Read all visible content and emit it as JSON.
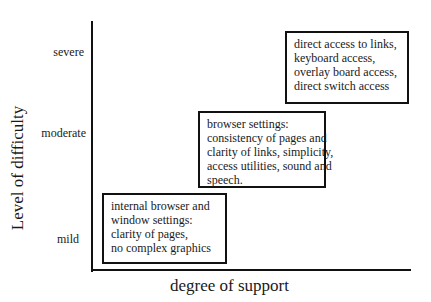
{
  "diagram": {
    "y_axis_label": "Level of difficulty",
    "x_axis_label": "degree of support",
    "y_ticks": [
      "severe",
      "moderate",
      "mild"
    ],
    "boxes": [
      {
        "level": "mild",
        "lines": [
          "internal browser and",
          "window settings:",
          "clarity of pages,",
          "no complex graphics"
        ]
      },
      {
        "level": "moderate",
        "lines": [
          "browser settings:",
          "consistency of pages and",
          "clarity of links, simplicity,",
          "access utilities, sound and",
          "speech."
        ]
      },
      {
        "level": "severe",
        "lines": [
          "direct access to links,",
          "keyboard access,",
          "overlay board access,",
          "direct switch access"
        ]
      }
    ]
  }
}
